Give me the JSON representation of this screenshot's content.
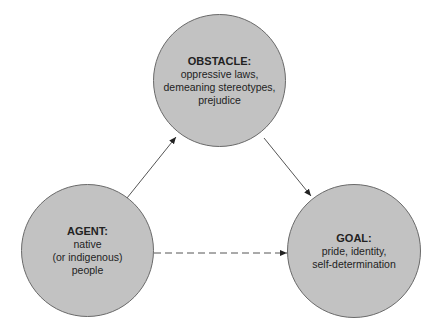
{
  "diagram": {
    "nodes": {
      "obstacle": {
        "title": "OBSTACLE:",
        "lines": [
          "oppressive laws,",
          "demeaning stereotypes,",
          "prejudice"
        ]
      },
      "agent": {
        "title": "AGENT:",
        "lines": [
          "native",
          "(or indigenous)",
          "people"
        ]
      },
      "goal": {
        "title": "GOAL:",
        "lines": [
          "pride, identity,",
          "self-determination"
        ]
      }
    },
    "edges": [
      {
        "from": "agent",
        "to": "obstacle",
        "style": "solid"
      },
      {
        "from": "obstacle",
        "to": "goal",
        "style": "solid"
      },
      {
        "from": "agent",
        "to": "goal",
        "style": "dashed"
      }
    ],
    "colors": {
      "node_fill": "#c2c2c2",
      "node_stroke": "#6a6a6a",
      "edge": "#555555"
    }
  }
}
